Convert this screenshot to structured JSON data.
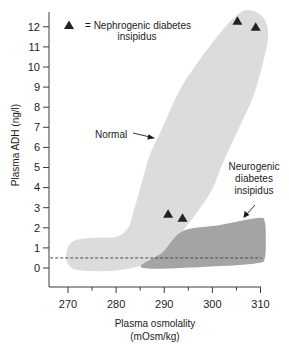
{
  "figure": {
    "legend": {
      "marker": "filled-triangle",
      "line1": "= Nephrogenic diabetes",
      "line2": "insipidus"
    },
    "labels": {
      "normal": "Normal",
      "neurogenic": [
        "Neurogenic",
        "diabetes",
        "insipidus"
      ]
    },
    "x_axis": {
      "title_line1": "Plasma osmolality",
      "title_line2": "(mOsm/kg)"
    },
    "y_axis": {
      "title": "Plasma ADH (ng/l)"
    }
  },
  "colors": {
    "normal_region": "#dcdcdc",
    "neurogenic_region": "#a4a4a4",
    "marker": "#222222",
    "axis": "#3a3a3a",
    "reference_line": "#4a4a4a",
    "text": "#1c1c1c"
  },
  "chart_data": {
    "type": "scatter",
    "title": "",
    "xlabel": "Plasma osmolality (mOsm/kg)",
    "ylabel": "Plasma ADH (ng/l)",
    "xlim": [
      270,
      310
    ],
    "ylim": [
      0,
      12
    ],
    "x_ticks": [
      270,
      280,
      290,
      300,
      310
    ],
    "x_minor_ticks": [
      275,
      285,
      295,
      305
    ],
    "y_ticks": [
      0,
      1,
      2,
      3,
      4,
      5,
      6,
      7,
      8,
      9,
      10,
      11,
      12
    ],
    "grid": false,
    "legend": {
      "position": "top-left",
      "entries": [
        {
          "marker": "triangle",
          "label": "= Nephrogenic diabetes insipidus"
        }
      ]
    },
    "series": [
      {
        "name": "Nephrogenic diabetes insipidus",
        "marker": "triangle",
        "points": [
          [
            305.2,
            12.3
          ],
          [
            309.0,
            12.0
          ],
          [
            290.8,
            2.7
          ],
          [
            293.8,
            2.5
          ]
        ]
      }
    ],
    "regions": [
      {
        "name": "Normal",
        "fill": "#dcdcdc",
        "outline": [
          [
            307.2,
            12.84
          ],
          [
            310.3,
            12.54
          ],
          [
            311.6,
            11.6
          ],
          [
            310.3,
            10.0
          ],
          [
            308.2,
            8.36
          ],
          [
            305.3,
            6.87
          ],
          [
            302.0,
            5.12
          ],
          [
            299.9,
            3.88
          ],
          [
            296.4,
            2.64
          ],
          [
            292.2,
            1.39
          ],
          [
            287.0,
            0.3
          ],
          [
            280.8,
            -0.1
          ],
          [
            274.6,
            -0.15
          ],
          [
            270.8,
            0.0
          ],
          [
            269.6,
            0.6
          ],
          [
            270.8,
            1.29
          ],
          [
            274.6,
            1.49
          ],
          [
            279.8,
            1.54
          ],
          [
            282.5,
            1.99
          ],
          [
            283.7,
            2.89
          ],
          [
            285.2,
            4.13
          ],
          [
            287.0,
            5.62
          ],
          [
            289.7,
            7.01
          ],
          [
            292.9,
            8.71
          ],
          [
            296.6,
            10.1
          ],
          [
            301.6,
            11.69
          ],
          [
            304.7,
            12.49
          ]
        ]
      },
      {
        "name": "Neurogenic diabetes insipidus",
        "fill": "#a4a4a4",
        "outline": [
          [
            285.6,
            0.0
          ],
          [
            289.7,
            0.8
          ],
          [
            293.9,
            1.84
          ],
          [
            301.6,
            2.14
          ],
          [
            309.5,
            2.49
          ],
          [
            310.9,
            2.29
          ],
          [
            311.1,
            1.39
          ],
          [
            310.9,
            0.5
          ],
          [
            309.5,
            0.25
          ],
          [
            301.6,
            0.1
          ]
        ]
      }
    ],
    "reference_lines": [
      {
        "orientation": "horizontal",
        "y": 0.5,
        "x_range": [
          266.3,
          310.3
        ],
        "style": "dashed"
      }
    ]
  }
}
